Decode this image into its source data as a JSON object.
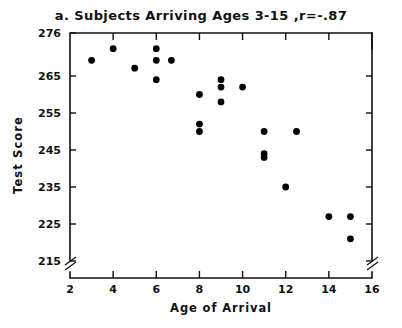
{
  "chart_data": {
    "type": "scatter",
    "title": "a. Subjects Arriving Ages 3-15 ,r=-.87",
    "xlabel": "Age of Arrival",
    "ylabel": "Test Score",
    "xlim": [
      2,
      16
    ],
    "ylim": [
      215,
      276
    ],
    "grid": false,
    "legend": "none",
    "axis_break_x": true,
    "axis_break_y": true,
    "xticks": [
      2,
      4,
      6,
      8,
      10,
      12,
      14,
      16
    ],
    "xtick_labels": [
      "2",
      "4",
      "6",
      "8",
      "10",
      "12",
      "14",
      "16"
    ],
    "yticks": [
      215,
      225,
      235,
      245,
      255,
      265,
      276
    ],
    "ytick_labels": [
      "215",
      "225",
      "235",
      "245",
      "255",
      "265",
      "276"
    ],
    "correlation": "-.87",
    "points": [
      {
        "x": 3.0,
        "y": 269
      },
      {
        "x": 4.0,
        "y": 272
      },
      {
        "x": 5.0,
        "y": 267
      },
      {
        "x": 6.0,
        "y": 272
      },
      {
        "x": 6.0,
        "y": 269
      },
      {
        "x": 6.0,
        "y": 264
      },
      {
        "x": 6.7,
        "y": 269
      },
      {
        "x": 8.0,
        "y": 260
      },
      {
        "x": 8.0,
        "y": 252
      },
      {
        "x": 8.0,
        "y": 250
      },
      {
        "x": 9.0,
        "y": 264
      },
      {
        "x": 9.0,
        "y": 262
      },
      {
        "x": 9.0,
        "y": 258
      },
      {
        "x": 10.0,
        "y": 262
      },
      {
        "x": 11.0,
        "y": 250
      },
      {
        "x": 11.0,
        "y": 244
      },
      {
        "x": 11.0,
        "y": 243
      },
      {
        "x": 12.5,
        "y": 250
      },
      {
        "x": 12.0,
        "y": 235
      },
      {
        "x": 14.0,
        "y": 227
      },
      {
        "x": 15.0,
        "y": 227
      },
      {
        "x": 15.0,
        "y": 221
      }
    ]
  }
}
